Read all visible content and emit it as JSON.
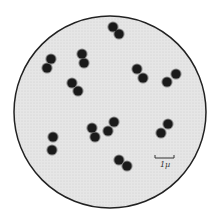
{
  "figure": {
    "field": {
      "cx": 110,
      "cy": 112,
      "r": 96,
      "fill": "#e4e4e4",
      "stroke": "#222222"
    },
    "scale_bar": {
      "label": "1µ",
      "x1": 155,
      "x2": 174,
      "y": 158
    },
    "cell_color": "#1a1a1a",
    "pairs": [
      [
        [
          113,
          27
        ],
        [
          119,
          34
        ]
      ],
      [
        [
          82,
          54
        ],
        [
          84,
          63
        ]
      ],
      [
        [
          51,
          59
        ],
        [
          47,
          68
        ]
      ],
      [
        [
          137,
          69
        ],
        [
          143,
          78
        ]
      ],
      [
        [
          176,
          74
        ],
        [
          167,
          82
        ]
      ],
      [
        [
          72,
          83
        ],
        [
          78,
          91
        ]
      ],
      [
        [
          114,
          122
        ],
        [
          108,
          131
        ]
      ],
      [
        [
          92,
          128
        ],
        [
          95,
          137
        ]
      ],
      [
        [
          168,
          124
        ],
        [
          161,
          133
        ]
      ],
      [
        [
          53,
          137
        ],
        [
          52,
          150
        ]
      ],
      [
        [
          119,
          160
        ],
        [
          127,
          166
        ]
      ]
    ]
  }
}
